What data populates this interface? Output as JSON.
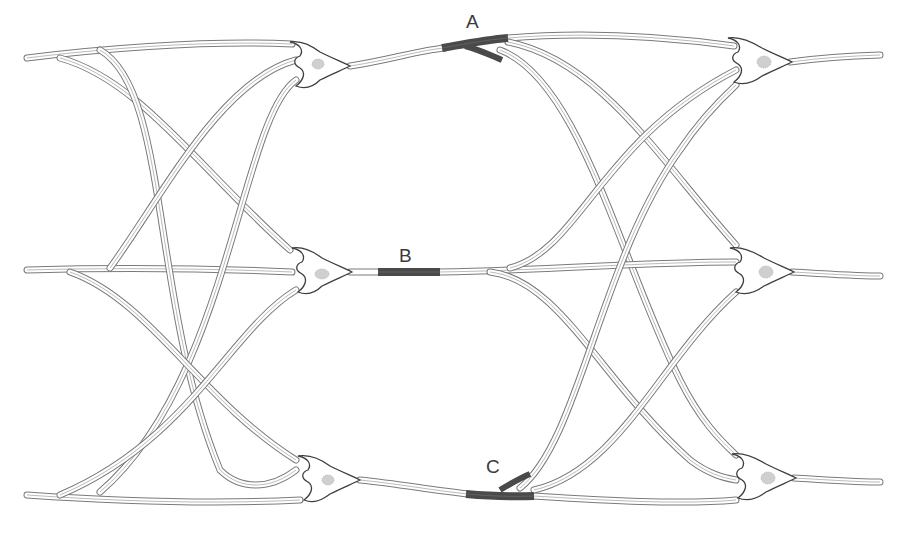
{
  "diagram": {
    "type": "neural-network-illustration",
    "background": "#ffffff",
    "fiber_color": "#7a7a7a",
    "highlight_color": "#4a4a4a",
    "labels": [
      {
        "id": "A",
        "text": "A",
        "x": 466,
        "y": 12
      },
      {
        "id": "B",
        "text": "B",
        "x": 399,
        "y": 246
      },
      {
        "id": "C",
        "text": "C",
        "x": 486,
        "y": 457
      }
    ],
    "neurons": [
      {
        "id": "left-top",
        "column": "left",
        "row": "top",
        "cx": 320,
        "cy": 66
      },
      {
        "id": "left-middle",
        "column": "left",
        "row": "middle",
        "cx": 322,
        "cy": 272
      },
      {
        "id": "left-bottom",
        "column": "left",
        "row": "bottom",
        "cx": 330,
        "cy": 480
      },
      {
        "id": "right-top",
        "column": "right",
        "row": "top",
        "cx": 762,
        "cy": 62
      },
      {
        "id": "right-middle",
        "column": "right",
        "row": "middle",
        "cx": 764,
        "cy": 272
      },
      {
        "id": "right-bottom",
        "column": "right",
        "row": "bottom",
        "cx": 766,
        "cy": 478
      }
    ],
    "highlighted_segments": [
      {
        "label": "A",
        "description": "convergence of fibers near top row"
      },
      {
        "label": "B",
        "description": "axon segment on middle row"
      },
      {
        "label": "C",
        "description": "convergence of fibers near bottom row"
      }
    ]
  }
}
